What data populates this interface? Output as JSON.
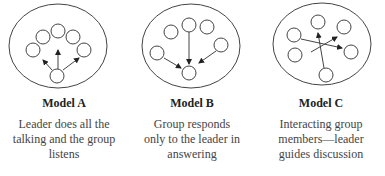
{
  "models": [
    {
      "title": "Model A",
      "description_lines": [
        "Leader does all the",
        "talking and the group",
        "listens"
      ]
    },
    {
      "title": "Model B",
      "description_lines": [
        "Group responds",
        "only to the leader in",
        "answering"
      ]
    },
    {
      "title": "Model C",
      "description_lines": [
        "Interacting group",
        "members—leader",
        "guides discussion"
      ]
    }
  ]
}
